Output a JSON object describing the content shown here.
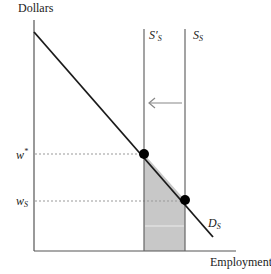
{
  "diagram": {
    "type": "labor-market-supply-shift",
    "y_axis_label": "Dollars",
    "x_axis_label": "Employment",
    "curves": {
      "demand": {
        "label": "D",
        "subscript": "S"
      },
      "supply_original": {
        "label": "S",
        "subscript": "S"
      },
      "supply_shifted": {
        "label": "S′",
        "subscript": "S"
      }
    },
    "wage_levels": [
      {
        "label": "w",
        "superscript": "*",
        "description": "equilibrium wage after supply shift"
      },
      {
        "label": "w",
        "subscript": "S",
        "description": "original equilibrium wage"
      }
    ],
    "arrow": {
      "direction": "left",
      "description": "supply shifts left"
    },
    "shaded_region": {
      "color": "#c8c8c8",
      "description": "area under demand curve between S′S and SS"
    },
    "colors": {
      "axis": "#555555",
      "demand_line": "#1a1a1a",
      "supply_lines": "#666666",
      "dashed_lines": "#999999",
      "points": "#000000",
      "arrow": "#888888",
      "shade": "#c8c8c8"
    }
  }
}
